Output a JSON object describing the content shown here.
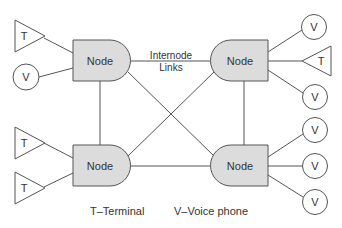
{
  "diagram": {
    "nodes": [
      {
        "id": "tl",
        "label": "Node"
      },
      {
        "id": "tr",
        "label": "Node"
      },
      {
        "id": "bl",
        "label": "Node"
      },
      {
        "id": "br",
        "label": "Node"
      }
    ],
    "internode_caption": {
      "line1": "Internode",
      "line2": "Links"
    },
    "devices": {
      "tl": [
        {
          "type": "terminal",
          "label": "T"
        },
        {
          "type": "voice",
          "label": "V"
        }
      ],
      "tr": [
        {
          "type": "voice",
          "label": "V"
        },
        {
          "type": "terminal",
          "label": "T"
        },
        {
          "type": "voice",
          "label": "V"
        }
      ],
      "bl": [
        {
          "type": "terminal",
          "label": "T"
        },
        {
          "type": "terminal",
          "label": "T"
        }
      ],
      "br": [
        {
          "type": "voice",
          "label": "V"
        },
        {
          "type": "voice",
          "label": "V"
        },
        {
          "type": "voice",
          "label": "V"
        }
      ]
    },
    "links": [
      [
        "tl",
        "tr"
      ],
      [
        "tl",
        "bl"
      ],
      [
        "tl",
        "br"
      ],
      [
        "tr",
        "bl"
      ],
      [
        "tr",
        "br"
      ],
      [
        "bl",
        "br"
      ]
    ],
    "legend": [
      {
        "key": "T",
        "text": "T–Terminal"
      },
      {
        "key": "V",
        "text": "V–Voice phone"
      }
    ]
  }
}
